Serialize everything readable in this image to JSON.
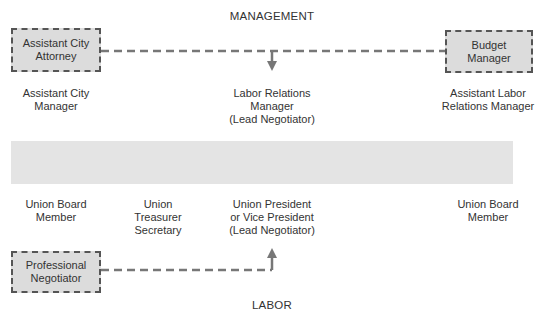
{
  "headings": {
    "top": "MANAGEMENT",
    "bottom": "LABOR"
  },
  "management": {
    "boxes": [
      {
        "id": "assistant-city-attorney",
        "label": "Assistant City Attorney",
        "line1": "Assistant City",
        "line2": "Attorney"
      },
      {
        "id": "budget-manager",
        "label": "Budget Manager",
        "line1": "Budget",
        "line2": "Manager"
      }
    ],
    "members": [
      {
        "id": "assistant-city-manager",
        "line1": "Assistant City",
        "line2": "Manager",
        "line3": ""
      },
      {
        "id": "labor-relations-manager",
        "line1": "Labor Relations",
        "line2": "Manager",
        "line3": "(Lead Negotiator)"
      },
      {
        "id": "assistant-labor-relations-manager",
        "line1": "Assistant Labor",
        "line2": "Relations Manager",
        "line3": ""
      }
    ]
  },
  "labor": {
    "members": [
      {
        "id": "union-board-member-left",
        "line1": "Union Board",
        "line2": "Member",
        "line3": ""
      },
      {
        "id": "union-treasurer-secretary",
        "line1": "Union",
        "line2": "Treasurer",
        "line3": "Secretary"
      },
      {
        "id": "union-president",
        "line1": "Union President",
        "line2": "or Vice President",
        "line3": "(Lead Negotiator)"
      },
      {
        "id": "union-board-member-right",
        "line1": "Union Board",
        "line2": "Member",
        "line3": ""
      }
    ],
    "boxes": [
      {
        "id": "professional-negotiator",
        "label": "Professional Negotiator",
        "line1": "Professional",
        "line2": "Negotiator"
      }
    ]
  },
  "colors": {
    "box_fill": "#dcdcdc",
    "dash": "#555555",
    "connector": "#777777",
    "band": "#e4e4e4",
    "text": "#333333"
  }
}
